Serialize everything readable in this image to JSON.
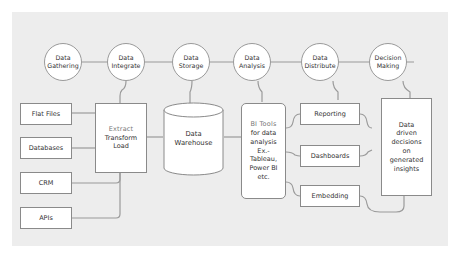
{
  "stages": [
    {
      "id": "gathering",
      "line1": "Data",
      "line2": "Gathering"
    },
    {
      "id": "integrate",
      "line1": "Data",
      "line2": "Integrate"
    },
    {
      "id": "storage",
      "line1": "Data",
      "line2": "Storage"
    },
    {
      "id": "analysis",
      "line1": "Data",
      "line2": "Analysis"
    },
    {
      "id": "distribute",
      "line1": "Data",
      "line2": "Distribute"
    },
    {
      "id": "decision",
      "line1": "Decision",
      "line2": "Making"
    }
  ],
  "sources": [
    "Flat Files",
    "Databases",
    "CRM",
    "APIs"
  ],
  "etl": {
    "line1": "Extract",
    "line2": "Transform",
    "line3": "Load"
  },
  "warehouse": {
    "line1": "Data",
    "line2": "Warehouse"
  },
  "bi_tools": [
    "BI Tools",
    "for data",
    "analysis",
    "Ex.-",
    "Tableau,",
    "Power BI",
    "etc."
  ],
  "outputs": [
    "Reporting",
    "Dashboards",
    "Embedding"
  ],
  "decision_box": [
    "Data",
    "driven",
    "decisions",
    "on",
    "generated",
    "insights"
  ]
}
